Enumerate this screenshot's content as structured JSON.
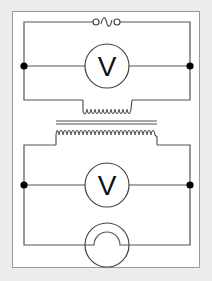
{
  "diagram": {
    "title": "",
    "type": "transformer circuit",
    "colors": {
      "background": "#ececec",
      "panel": "#ffffff",
      "panel_border": "#9a9a9a",
      "wire": "#555555",
      "junction": "#000000"
    },
    "primary_circuit": {
      "source": {
        "symbol": "ac-source-icon",
        "glyph": "∿"
      },
      "meter": {
        "symbol": "voltmeter-icon",
        "label": "V"
      },
      "coil": "primary-coil"
    },
    "core": "iron-core",
    "secondary_circuit": {
      "coil": "secondary-coil",
      "meter": {
        "symbol": "voltmeter-icon",
        "label": "V"
      },
      "load": {
        "symbol": "lamp-icon"
      }
    }
  }
}
